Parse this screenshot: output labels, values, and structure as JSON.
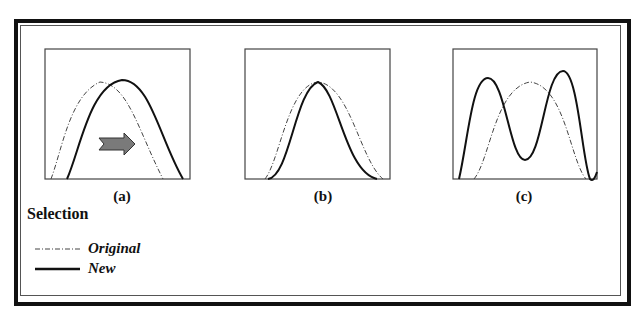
{
  "figure": {
    "panels": [
      {
        "id": "a",
        "label": "(a)",
        "description": "New distribution shifted right relative to Original",
        "arrow": "right-arrow"
      },
      {
        "id": "b",
        "label": "(b)",
        "description": "New distribution narrower, same peak as Original"
      },
      {
        "id": "c",
        "label": "(c)",
        "description": "New distribution bimodal, Original unimodal"
      }
    ],
    "title": "Selection",
    "legend": [
      {
        "name": "Original",
        "style": "dash-dot",
        "color": "#333333"
      },
      {
        "name": "New",
        "style": "solid",
        "color": "#111111"
      }
    ],
    "colors": {
      "frame": "#111111",
      "curve_new": "#111111",
      "curve_original": "#444444",
      "arrow_fill": "#7a7a7a",
      "arrow_stroke": "#333333"
    }
  }
}
